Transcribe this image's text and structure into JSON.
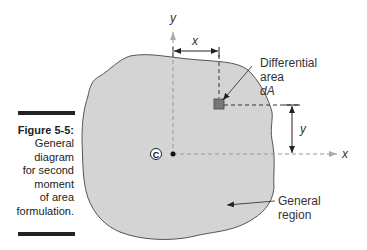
{
  "caption": {
    "figure_label": "Figure 5-5:",
    "lines": [
      "General",
      "diagram",
      "for second",
      "moment",
      "of area",
      "formulation."
    ]
  },
  "diagram": {
    "axis_y_label": "y",
    "axis_x_label": "x",
    "dim_x_label": "x",
    "dim_y_label": "y",
    "centroid_label": "C",
    "differential_area_label_lines": [
      "Differential",
      "area",
      "dA"
    ],
    "region_label_lines": [
      "General",
      "region"
    ],
    "colors": {
      "region_fill": "#d4d4d4",
      "region_stroke": "#555555",
      "element_fill": "#777777",
      "axis_dash": "#999999"
    }
  }
}
